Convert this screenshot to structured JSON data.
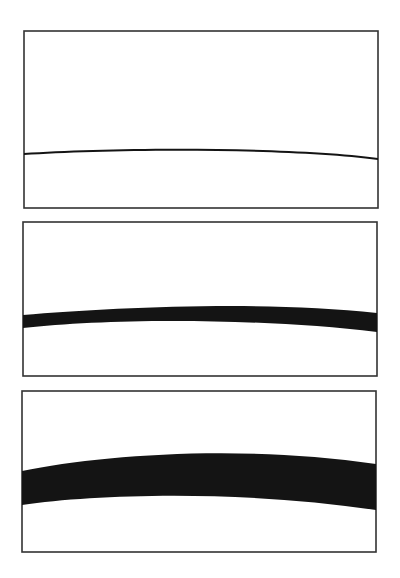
{
  "figure": {
    "colors": {
      "background": "#ffffff",
      "frame": "#333333",
      "band": "#141414"
    },
    "panels": [
      {
        "name": "panel-thin-line",
        "frame": {
          "x": 24,
          "y": 31,
          "w": 354,
          "h": 177
        },
        "band_path": "M24,153 C110,147 290,146 378,158 L378,160 C290,148 110,149 24,155 Z"
      },
      {
        "name": "panel-medium-band",
        "frame": {
          "x": 23,
          "y": 222,
          "w": 354,
          "h": 154
        },
        "band_path": "M23,315 C110,308 260,300 377,313 L377,332 C260,318 110,318 23,328 Z"
      },
      {
        "name": "panel-thick-band",
        "frame": {
          "x": 22,
          "y": 391,
          "w": 354,
          "h": 161
        },
        "band_path": "M22,471 C100,455 240,444 376,464 L376,510 C240,490 100,494 22,505 Z"
      }
    ]
  }
}
